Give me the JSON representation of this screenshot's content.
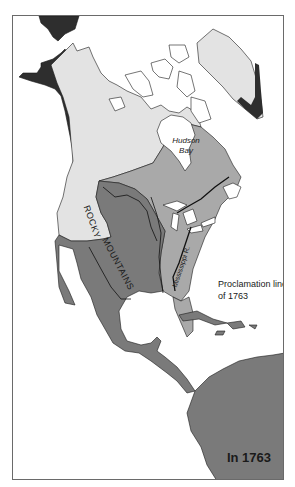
{
  "map": {
    "title": "In 1763",
    "labels": {
      "hudson_bay_line1": "Hudson",
      "hudson_bay_line2": "Bay",
      "rocky_part1": "ROCKY",
      "rocky_part2": "MOUNTAINS",
      "mississippi": "Mississippi R.",
      "proclamation_line1": "Proclamation line",
      "proclamation_line2": "of 1763"
    },
    "legend_colors": {
      "darkest": "#2e2e2e",
      "dark_gray": "#7a7a7a",
      "medium_gray": "#a9a9a9",
      "light_gray": "#e3e3e3",
      "water": "#ffffff",
      "outline": "#1a1a1a"
    }
  }
}
